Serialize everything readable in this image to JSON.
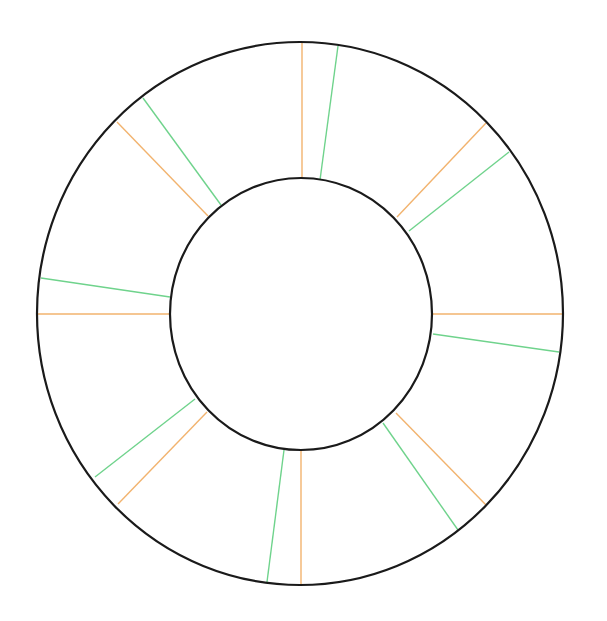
{
  "diagram": {
    "type": "annulus-with-spokes",
    "colors": {
      "background": "#ffffff",
      "ring_stroke": "#1a1a1a",
      "primary_spoke": "#f2b36e",
      "secondary_spoke": "#6fd38c"
    },
    "outer_ring": {
      "cx": 300,
      "cy": 313.5,
      "rx": 263,
      "ry": 271.5,
      "stroke_width": 2.2
    },
    "inner_ring": {
      "cx": 301,
      "cy": 314,
      "rx": 131,
      "ry": 136,
      "stroke_width": 2.2
    },
    "primary_spokes": [
      {
        "x1": 302,
        "y1": 178,
        "x2": 302,
        "y2": 42
      },
      {
        "x1": 397,
        "y1": 217,
        "x2": 486,
        "y2": 123
      },
      {
        "x1": 432,
        "y1": 314,
        "x2": 563,
        "y2": 314
      },
      {
        "x1": 396,
        "y1": 413,
        "x2": 486,
        "y2": 505
      },
      {
        "x1": 301,
        "y1": 451,
        "x2": 301,
        "y2": 585
      },
      {
        "x1": 207,
        "y1": 412,
        "x2": 118,
        "y2": 504
      },
      {
        "x1": 170,
        "y1": 314,
        "x2": 38,
        "y2": 314
      },
      {
        "x1": 208,
        "y1": 216,
        "x2": 117,
        "y2": 122
      }
    ],
    "secondary_spokes": [
      {
        "x1": 320,
        "y1": 180,
        "x2": 338,
        "y2": 46
      },
      {
        "x1": 409,
        "y1": 231,
        "x2": 509,
        "y2": 152
      },
      {
        "x1": 433,
        "y1": 334,
        "x2": 559,
        "y2": 352
      },
      {
        "x1": 383,
        "y1": 423,
        "x2": 458,
        "y2": 530
      },
      {
        "x1": 284,
        "y1": 450,
        "x2": 267,
        "y2": 582
      },
      {
        "x1": 195,
        "y1": 399,
        "x2": 95,
        "y2": 477
      },
      {
        "x1": 170,
        "y1": 297,
        "x2": 41,
        "y2": 278
      },
      {
        "x1": 221,
        "y1": 205,
        "x2": 143,
        "y2": 98
      }
    ]
  }
}
